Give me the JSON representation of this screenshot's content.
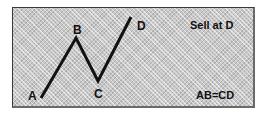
{
  "diagram": {
    "points": [
      {
        "label": "A",
        "x": 0,
        "y": 0
      },
      {
        "label": "B",
        "x": 1,
        "y": 1
      },
      {
        "label": "C",
        "x": 1.5,
        "y": 0.4
      },
      {
        "label": "D",
        "x": 2.5,
        "y": 1.4
      }
    ],
    "annotations": {
      "action": "Sell at D",
      "rule": "AB=CD"
    },
    "colors": {
      "line": "#111111",
      "panel": "#c8c8c8"
    }
  }
}
